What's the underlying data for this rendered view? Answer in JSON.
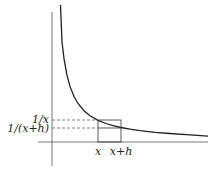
{
  "diagram": {
    "function": "y = 1/x",
    "labels": {
      "x": "x",
      "x_plus_h": "x+h",
      "inv_x": "1/x",
      "inv_x_plus_h": "1/(x+h)"
    },
    "colors": {
      "curve": "#222222",
      "axis": "#444444",
      "guide": "#666666",
      "rect": "#333333"
    }
  }
}
